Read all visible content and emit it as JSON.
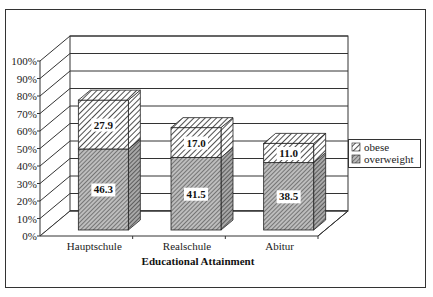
{
  "chart_data": {
    "type": "bar",
    "stacked": true,
    "three_d": true,
    "title": "",
    "xlabel": "Educational Attainment",
    "ylabel": "",
    "ylim": [
      0,
      100
    ],
    "yticks": [
      "0%",
      "10%",
      "20%",
      "30%",
      "40%",
      "50%",
      "60%",
      "70%",
      "80%",
      "90%",
      "100%"
    ],
    "categories": [
      "Hauptschule",
      "Realschule",
      "Abitur"
    ],
    "series": [
      {
        "name": "overweight",
        "values": [
          46.3,
          41.5,
          38.5
        ],
        "pattern": "fine-crosshatch",
        "color": "#9a9a9a"
      },
      {
        "name": "obese",
        "values": [
          27.9,
          17.0,
          11.0
        ],
        "pattern": "diagonal-stripes",
        "color": "#ffffff"
      }
    ],
    "data_labels": {
      "overweight": [
        "46.3",
        "41.5",
        "38.5"
      ],
      "obese": [
        "27.9",
        "17.0",
        "11.0"
      ]
    },
    "legend": {
      "position": "right",
      "entries": [
        "obese",
        "overweight"
      ]
    },
    "grid": true
  }
}
